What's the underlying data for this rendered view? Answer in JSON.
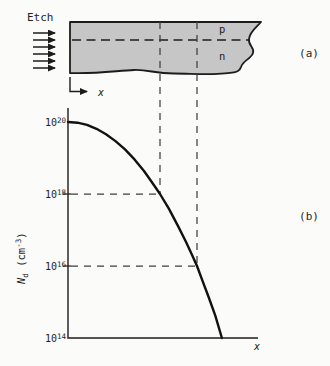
{
  "panel_a": {
    "etch_label": "Etch",
    "region_p_label": "p",
    "region_n_label": "n",
    "panel_label": "(a)",
    "x_axis_label": "x"
  },
  "panel_b": {
    "panel_label": "(b)",
    "x_axis_label": "x",
    "ylabel_symbol": "N",
    "ylabel_sub": "d",
    "ylabel_unit_open": " (cm",
    "ylabel_unit_sup": "-3",
    "ylabel_unit_close": ")"
  },
  "colors": {
    "ink": "#1c1c1c",
    "bar_fill": "#c6c6c6",
    "background": "#fbfbf9",
    "guide": "#3f3f3f"
  },
  "chart_data": {
    "type": "line",
    "xlabel": "x",
    "ylabel": "Nd (cm^-3)",
    "y_scale": "log10",
    "ylim_log10": [
      14,
      20
    ],
    "grid": false,
    "y_ticks": [
      {
        "base": "10",
        "exp": "20",
        "log10": 20
      },
      {
        "base": "10",
        "exp": "18",
        "log10": 18
      },
      {
        "base": "10",
        "exp": "16",
        "log10": 16
      },
      {
        "base": "10",
        "exp": "14",
        "log10": 14
      }
    ],
    "series": [
      {
        "name": "donor concentration profile Nd(x)",
        "points": [
          {
            "f": 0.0,
            "logn": 20.0
          },
          {
            "f": 0.05,
            "logn": 19.98
          },
          {
            "f": 0.1,
            "logn": 19.92
          },
          {
            "f": 0.15,
            "logn": 19.81
          },
          {
            "f": 0.2,
            "logn": 19.66
          },
          {
            "f": 0.25,
            "logn": 19.47
          },
          {
            "f": 0.3,
            "logn": 19.24
          },
          {
            "f": 0.35,
            "logn": 18.96
          },
          {
            "f": 0.4,
            "logn": 18.64
          },
          {
            "f": 0.44,
            "logn": 18.34
          },
          {
            "f": 0.484,
            "logn": 18.0
          },
          {
            "f": 0.53,
            "logn": 17.6
          },
          {
            "f": 0.58,
            "logn": 17.1
          },
          {
            "f": 0.62,
            "logn": 16.68
          },
          {
            "f": 0.65,
            "logn": 16.34
          },
          {
            "f": 0.679,
            "logn": 16.0
          },
          {
            "f": 0.71,
            "logn": 15.56
          },
          {
            "f": 0.74,
            "logn": 15.14
          },
          {
            "f": 0.775,
            "logn": 14.62
          },
          {
            "f": 0.81,
            "logn": 14.0
          }
        ]
      }
    ],
    "guides": [
      {
        "x_frac": 0.484,
        "log10_n": 18
      },
      {
        "x_frac": 0.679,
        "log10_n": 16
      }
    ]
  }
}
